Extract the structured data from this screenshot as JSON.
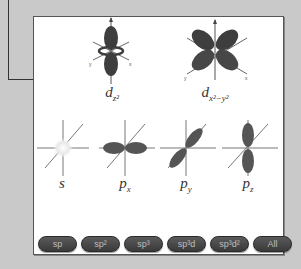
{
  "orbitals": {
    "dz2": {
      "label_main": "d",
      "label_sub": "z²"
    },
    "dx2y2": {
      "label_main": "d",
      "label_sub": "x²−y²"
    },
    "s": {
      "label_main": "s"
    },
    "px": {
      "label_main": "p",
      "label_sub": "x"
    },
    "py": {
      "label_main": "p",
      "label_sub": "y"
    },
    "pz": {
      "label_main": "p",
      "label_sub": "z"
    }
  },
  "axis_labels": {
    "x": "x",
    "y": "y",
    "z": "z"
  },
  "buttons": [
    {
      "label": "sp"
    },
    {
      "label": "sp²"
    },
    {
      "label": "sp³"
    },
    {
      "label": "sp³d"
    },
    {
      "label": "sp³d²"
    },
    {
      "label": "All"
    }
  ],
  "colors": {
    "background": "#c9c9c9",
    "panel": "#ffffff",
    "lobe_dark": "#3e3e3e",
    "lobe_mid": "#6a6a6a",
    "button": "#444444",
    "button_text": "#bdbdbd"
  }
}
